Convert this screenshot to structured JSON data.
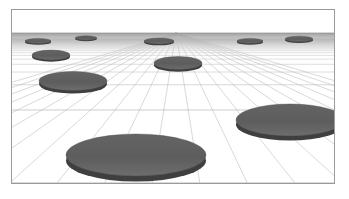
{
  "scene": {
    "title": "Perspective grid floor with scattered discs",
    "width": 349,
    "height": 199,
    "page_background": "#ffffff",
    "frame": {
      "x": 11,
      "y": 9,
      "width": 324,
      "height": 175,
      "border_color": "#9a9a9a",
      "border_width": 1
    },
    "sky": {
      "label": "sky",
      "color": "#ffffff",
      "height": 23
    },
    "floor": {
      "label": "perspective-grid-floor",
      "background": "#ffffff",
      "line_color": "#b9b9b9",
      "far_band_color": "#9d9d9d",
      "horizon_y": 23,
      "vanishing_point_x": 164,
      "vanishing_point_y": 23,
      "radial_line_count": 21,
      "depth_line_count": 26,
      "far_haze_opacity": 0.75
    },
    "discs": [
      {
        "id": "disc-01",
        "name": "disc-far-left",
        "cx": 26,
        "cy": 31,
        "rx": 13,
        "ry": 2.6,
        "thickness": 1.2
      },
      {
        "id": "disc-02",
        "name": "disc-far-left-inner",
        "cx": 74,
        "cy": 28,
        "rx": 11,
        "ry": 2.2,
        "thickness": 1.0
      },
      {
        "id": "disc-03",
        "name": "disc-far-center",
        "cx": 147,
        "cy": 31,
        "rx": 15,
        "ry": 3.0,
        "thickness": 1.3
      },
      {
        "id": "disc-04",
        "name": "disc-far-right-inner",
        "cx": 238,
        "cy": 31,
        "rx": 13,
        "ry": 2.6,
        "thickness": 1.2
      },
      {
        "id": "disc-05",
        "name": "disc-far-right",
        "cx": 287,
        "cy": 29,
        "rx": 14,
        "ry": 2.8,
        "thickness": 1.2
      },
      {
        "id": "disc-06",
        "name": "disc-mid-left-upper",
        "cx": 39,
        "cy": 45,
        "rx": 19,
        "ry": 5.0,
        "thickness": 1.8
      },
      {
        "id": "disc-07",
        "name": "disc-mid-center",
        "cx": 166,
        "cy": 53,
        "rx": 24,
        "ry": 6.5,
        "thickness": 2.2
      },
      {
        "id": "disc-08",
        "name": "disc-mid-left-lower",
        "cx": 61,
        "cy": 71,
        "rx": 34,
        "ry": 9.5,
        "thickness": 3.0
      },
      {
        "id": "disc-09",
        "name": "disc-near-right",
        "cx": 278,
        "cy": 110,
        "rx": 54,
        "ry": 16,
        "thickness": 4.5
      },
      {
        "id": "disc-10",
        "name": "disc-near-center",
        "cx": 124,
        "cy": 145,
        "rx": 70,
        "ry": 21,
        "thickness": 5.5
      }
    ],
    "disc_style": {
      "fill_top": "#5e5e5e",
      "fill_bottom": "#6b6b6b",
      "edge_color": "#3f3f3f",
      "rim_color": "#4a4a4a"
    }
  }
}
